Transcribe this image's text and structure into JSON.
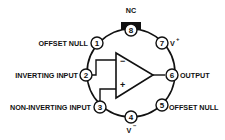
{
  "diagram": {
    "type": "op-amp-pinout",
    "package": "8-pin circular (TO-99 style)",
    "pins": [
      {
        "number": "1",
        "label": "OFFSET NULL"
      },
      {
        "number": "2",
        "label": "INVERTING INPUT"
      },
      {
        "number": "3",
        "label": "NON-INVERTING INPUT"
      },
      {
        "number": "4",
        "label": "V",
        "superscript": "−"
      },
      {
        "number": "5",
        "label": "OFFSET NULL"
      },
      {
        "number": "6",
        "label": "OUTPUT"
      },
      {
        "number": "7",
        "label": "V",
        "superscript": "+"
      },
      {
        "number": "8",
        "label": "NC"
      }
    ],
    "amplifier": {
      "inverting_sign": "−",
      "noninverting_sign": "+"
    }
  }
}
